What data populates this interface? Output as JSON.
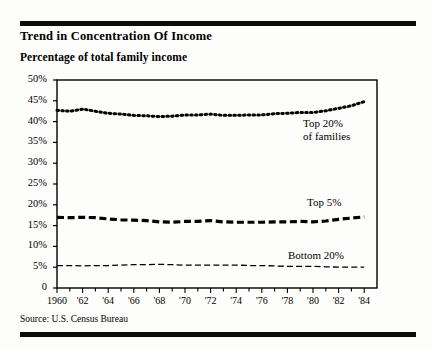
{
  "header": {
    "title": "Trend in Concentration Of Income",
    "subtitle": "Percentage of total family income"
  },
  "source": {
    "text": "Source: U.S. Census Bureau"
  },
  "chart_data": {
    "type": "line",
    "title": "Trend in Concentration Of Income",
    "subtitle": "Percentage of total family income",
    "xlabel": "",
    "ylabel": "Percentage of total family income",
    "ylim": [
      0,
      50
    ],
    "xlim": [
      1960,
      1985
    ],
    "grid": false,
    "legend_position": "inline-annotation",
    "y_ticks": [
      0,
      5,
      10,
      15,
      20,
      25,
      30,
      35,
      40,
      45,
      50
    ],
    "y_tick_labels": [
      "0",
      "5%",
      "10%",
      "15%",
      "20%",
      "25%",
      "30%",
      "35%",
      "40%",
      "45%",
      "50%"
    ],
    "x_ticks": [
      1960,
      1961,
      1962,
      1963,
      1964,
      1965,
      1966,
      1967,
      1968,
      1969,
      1970,
      1971,
      1972,
      1973,
      1974,
      1975,
      1976,
      1977,
      1978,
      1979,
      1980,
      1981,
      1982,
      1983,
      1984
    ],
    "x_tick_labels": [
      "1960",
      "'62",
      "'64",
      "'66",
      "'68",
      "'70",
      "'72",
      "'74",
      "'76",
      "'78",
      "'80",
      "'82",
      "'84"
    ],
    "x_labeled_years": [
      1960,
      1962,
      1964,
      1966,
      1968,
      1970,
      1972,
      1974,
      1976,
      1978,
      1980,
      1982,
      1984
    ],
    "x": [
      1960,
      1961,
      1962,
      1963,
      1964,
      1965,
      1966,
      1967,
      1968,
      1969,
      1970,
      1971,
      1972,
      1973,
      1974,
      1975,
      1976,
      1977,
      1978,
      1979,
      1980,
      1981,
      1982,
      1983,
      1984
    ],
    "series": [
      {
        "name": "Top 20% of families",
        "annotation": "Top 20%\nof families",
        "annotation_line1": "Top 20%",
        "annotation_line2": "of families",
        "style": "dotted",
        "color": "#000000",
        "values": [
          42.7,
          42.5,
          43.0,
          42.5,
          42.0,
          41.8,
          41.5,
          41.4,
          41.2,
          41.3,
          41.6,
          41.6,
          41.8,
          41.5,
          41.5,
          41.6,
          41.6,
          41.9,
          42.0,
          42.2,
          42.2,
          42.6,
          43.2,
          43.8,
          44.8
        ],
        "start_value": 42.7,
        "end_value": 44.8
      },
      {
        "name": "Top 5%",
        "annotation": "Top 5%",
        "annotation_line1": "Top 5%",
        "style": "dashed",
        "color": "#000000",
        "values": [
          17.0,
          16.9,
          17.0,
          16.9,
          16.6,
          16.4,
          16.3,
          16.2,
          15.9,
          15.8,
          16.0,
          16.0,
          16.2,
          15.9,
          15.8,
          15.8,
          15.8,
          15.9,
          15.9,
          16.0,
          15.9,
          16.1,
          16.5,
          16.8,
          17.1
        ],
        "start_value": 17.0,
        "end_value": 17.1
      },
      {
        "name": "Bottom 20%",
        "annotation": "Bottom 20%",
        "annotation_line1": "Bottom 20%",
        "style": "fine-dashed",
        "color": "#000000",
        "values": [
          5.4,
          5.4,
          5.3,
          5.4,
          5.4,
          5.5,
          5.6,
          5.6,
          5.7,
          5.6,
          5.5,
          5.5,
          5.5,
          5.5,
          5.5,
          5.4,
          5.4,
          5.3,
          5.2,
          5.2,
          5.2,
          5.1,
          5.0,
          5.0,
          5.0
        ],
        "start_value": 5.4,
        "end_value": 5.0
      }
    ]
  },
  "plot_geometry": {
    "left": 57,
    "right": 377,
    "top": 80,
    "bottom": 288
  }
}
